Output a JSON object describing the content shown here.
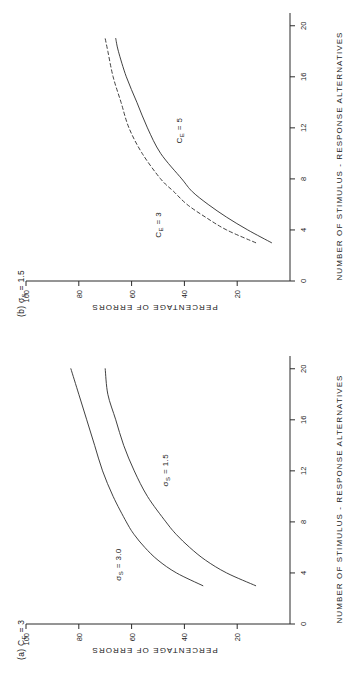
{
  "figure": {
    "background_color": "#ffffff",
    "ink_color": "#2b2b2b",
    "orientation": "rotated-90-ccw",
    "panels": [
      {
        "id": "panel-a",
        "label": "(a)",
        "label_symbol": "C",
        "label_subscript": "E",
        "label_value": "= 3",
        "label_full": "(a) Cₑ = 3",
        "curves": [
          {
            "name": "sigma-s-3-0",
            "label_symbol": "σ",
            "label_subscript": "S",
            "label_value": "= 3.0",
            "label_full": "σₛ = 3.0",
            "style": "solid"
          },
          {
            "name": "sigma-s-1-5",
            "label_symbol": "σ",
            "label_subscript": "S",
            "label_value": "= 1.5",
            "label_full": "σₛ = 1.5",
            "style": "solid"
          }
        ]
      },
      {
        "id": "panel-b",
        "label": "(b)",
        "label_symbol": "σ",
        "label_subscript": "S",
        "label_value": "= 1.5",
        "label_full": "(b) σₛ = 1.5",
        "curves": [
          {
            "name": "c-e-3",
            "label_symbol": "C",
            "label_subscript": "E",
            "label_value": "= 3",
            "label_full": "Cₑ = 3",
            "style": "dashed"
          },
          {
            "name": "c-e-5",
            "label_symbol": "C",
            "label_subscript": "E",
            "label_value": "= 5",
            "label_full": "Cₑ = 5",
            "style": "solid"
          }
        ]
      }
    ]
  },
  "chart_data": [
    {
      "type": "line",
      "panel": "(a)",
      "title": "(a) C_E = 3",
      "xlabel": "NUMBER OF STIMULUS - RESPONSE ALTERNATIVES",
      "ylabel": "PERCENTAGE OF ERRORS",
      "xlim": [
        0,
        21
      ],
      "ylim": [
        0,
        100
      ],
      "xticks": [
        0,
        4,
        8,
        12,
        16,
        20
      ],
      "xticklabels": [
        "0",
        "4",
        "8",
        "12",
        "16",
        "20"
      ],
      "yticks": [
        20,
        40,
        60,
        80,
        100
      ],
      "yticklabels": [
        "20",
        "40",
        "60",
        "80",
        "100"
      ],
      "grid": false,
      "legend": "inline-annotations",
      "series": [
        {
          "name": "σ_S = 3.0",
          "style": "solid",
          "x": [
            3,
            4,
            5,
            6,
            7,
            8,
            10,
            12,
            14,
            16,
            18,
            20
          ],
          "y": [
            33,
            43,
            50,
            55,
            59,
            62,
            67,
            71,
            74,
            77,
            80,
            83
          ]
        },
        {
          "name": "σ_S = 1.5",
          "style": "solid",
          "x": [
            3,
            4,
            5,
            6,
            7,
            8,
            10,
            12,
            14,
            16,
            18,
            20
          ],
          "y": [
            13,
            24,
            32,
            38,
            43,
            47,
            54,
            59,
            63,
            66,
            69,
            70
          ]
        }
      ]
    },
    {
      "type": "line",
      "panel": "(b)",
      "title": "(b) σ_S = 1.5",
      "xlabel": "NUMBER OF STIMULUS - RESPONSE ALTERNATIVES",
      "ylabel": "PERCENTAGE OF ERRORS",
      "xlim": [
        0,
        21
      ],
      "ylim": [
        0,
        100
      ],
      "xticks": [
        0,
        4,
        8,
        12,
        16,
        20
      ],
      "xticklabels": [
        "0",
        "4",
        "8",
        "12",
        "16",
        "20"
      ],
      "yticks": [
        20,
        40,
        60,
        80,
        100
      ],
      "yticklabels": [
        "20",
        "40",
        "60",
        "80",
        "100"
      ],
      "grid": false,
      "legend": "inline-annotations",
      "series": [
        {
          "name": "C_E = 3",
          "style": "dashed",
          "x": [
            3,
            4,
            5,
            6,
            7,
            8,
            10,
            12,
            14,
            16,
            18,
            19
          ],
          "y": [
            13,
            24,
            32,
            39,
            44,
            49,
            56,
            61,
            64,
            67,
            69,
            70
          ]
        },
        {
          "name": "C_E = 5",
          "style": "solid",
          "x": [
            3,
            4,
            5,
            6,
            7,
            8,
            10,
            12,
            14,
            16,
            18,
            19
          ],
          "y": [
            7,
            16,
            24,
            31,
            37,
            41,
            49,
            54,
            58,
            62,
            65,
            66
          ]
        }
      ]
    }
  ],
  "axes": {
    "x_title": "NUMBER  OF  STIMULUS - RESPONSE  ALTERNATIVES",
    "y_title": "PERCENTAGE  OF  ERRORS",
    "x_ticklabels": [
      "0",
      "4",
      "8",
      "12",
      "16",
      "20"
    ],
    "y_ticklabels": [
      "20",
      "40",
      "60",
      "80",
      "100"
    ]
  }
}
